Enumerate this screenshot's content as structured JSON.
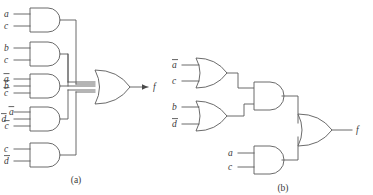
{
  "figure": {
    "line_color": "#5a5a5a",
    "text_color": "#3a3a3a",
    "background": "#ffffff"
  },
  "panel_a": {
    "caption": "(a)",
    "output_label": "f",
    "gates": [
      {
        "id": "and-1",
        "type": "AND",
        "inputs": [
          {
            "label": "a",
            "bar": false
          },
          {
            "label": "c",
            "bar": false
          }
        ]
      },
      {
        "id": "and-2",
        "type": "AND",
        "inputs": [
          {
            "label": "b",
            "bar": false
          },
          {
            "label": "c",
            "bar": false
          }
        ]
      },
      {
        "id": "and-3",
        "type": "AND",
        "inputs": [
          {
            "label": "a",
            "bar": true
          },
          {
            "label": "b",
            "bar": true
          },
          {
            "label": "c",
            "bar": true
          }
        ]
      },
      {
        "id": "and-4",
        "type": "AND",
        "inputs": [
          {
            "label": "d",
            "bar": true
          },
          {
            "label": "a",
            "bar": true
          },
          {
            "label": "c",
            "bar": true
          }
        ]
      },
      {
        "id": "and-5",
        "type": "AND",
        "inputs": [
          {
            "label": "c",
            "bar": false
          },
          {
            "label": "d",
            "bar": true
          }
        ]
      },
      {
        "id": "or-out",
        "type": "OR",
        "inputs": []
      }
    ]
  },
  "panel_b": {
    "caption": "(b)",
    "output_label": "f",
    "gates": [
      {
        "id": "or-1",
        "type": "OR",
        "inputs": [
          {
            "label": "a",
            "bar": true
          },
          {
            "label": "c",
            "bar": false
          }
        ]
      },
      {
        "id": "or-2",
        "type": "OR",
        "inputs": [
          {
            "label": "b",
            "bar": false
          },
          {
            "label": "d",
            "bar": true
          }
        ]
      },
      {
        "id": "and-mid",
        "type": "AND",
        "inputs": []
      },
      {
        "id": "and-bot",
        "type": "AND",
        "inputs": [
          {
            "label": "a",
            "bar": false
          },
          {
            "label": "c",
            "bar": false
          }
        ]
      },
      {
        "id": "or-out",
        "type": "OR",
        "inputs": []
      }
    ]
  },
  "labels": {
    "a_g1_in1": "a",
    "a_g1_in2": "c",
    "a_g2_in1": "b",
    "a_g2_in2": "c",
    "a_g3_in1": "a",
    "a_g3_in2": "b",
    "a_g3_in3": "c",
    "a_g4_in1": "d",
    "a_g4_in2": "a",
    "a_g4_in3": "c",
    "a_g5_in1": "c",
    "a_g5_in2": "d",
    "a_out": "f",
    "a_caption": "(a)",
    "b_g1_in1": "a",
    "b_g1_in2": "c",
    "b_g2_in1": "b",
    "b_g2_in2": "d",
    "b_g4_in1": "a",
    "b_g4_in2": "c",
    "b_out": "f",
    "b_caption": "(b)"
  }
}
